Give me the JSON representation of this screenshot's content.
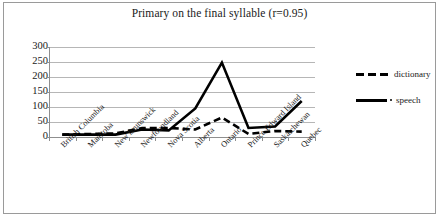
{
  "chart_data": {
    "type": "line",
    "title": "Primary on the final syllable (r=0.95)",
    "xlabel": "",
    "ylabel": "",
    "ylim": [
      0,
      300
    ],
    "yticks": [
      0,
      50,
      100,
      150,
      200,
      250,
      300
    ],
    "grid": true,
    "legend_position": "right",
    "categories": [
      "British Columbia",
      "Manitoba",
      "New Brunswick",
      "Newfoundland",
      "Nova Scotia",
      "Alberta",
      "Ontario",
      "Prince Edward Island",
      "Saskatchewan",
      "Quebec"
    ],
    "series": [
      {
        "name": "dictionary",
        "style": "dashed",
        "color": "#000000",
        "values": [
          8,
          10,
          12,
          30,
          30,
          25,
          65,
          10,
          20,
          18
        ]
      },
      {
        "name": "speech",
        "style": "solid",
        "color": "#000000",
        "values": [
          8,
          8,
          8,
          25,
          22,
          95,
          248,
          30,
          35,
          120
        ]
      }
    ]
  },
  "legend": {
    "items": [
      {
        "label": "dictionary",
        "style": "dashed"
      },
      {
        "label": "speech",
        "style": "solid"
      }
    ]
  }
}
